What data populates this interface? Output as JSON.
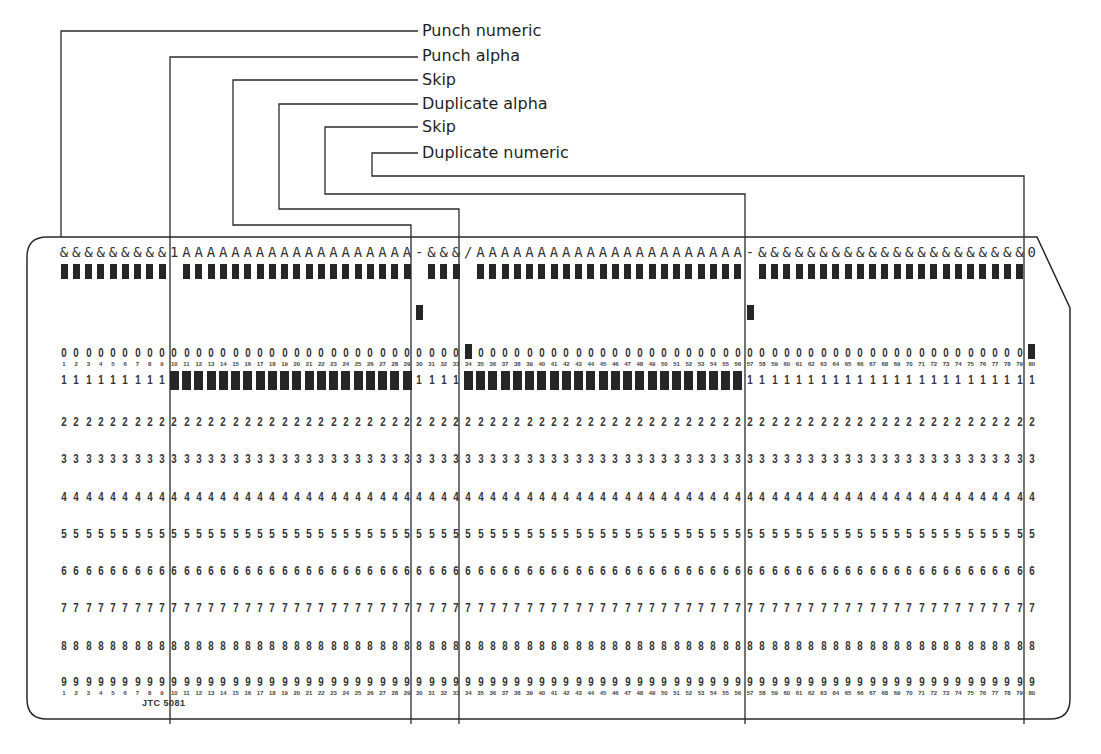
{
  "figure": {
    "labels": [
      {
        "id": "punch-numeric",
        "text": "Punch numeric",
        "columns": [
          1,
          9
        ]
      },
      {
        "id": "punch-alpha",
        "text": "Punch alpha",
        "columns": [
          10,
          29
        ]
      },
      {
        "id": "skip-1",
        "text": "Skip",
        "columns": [
          30,
          33
        ]
      },
      {
        "id": "duplicate-alpha",
        "text": "Duplicate alpha",
        "columns": [
          34,
          56
        ]
      },
      {
        "id": "skip-2",
        "text": "Skip",
        "columns": [
          57,
          79
        ]
      },
      {
        "id": "duplicate-numeric",
        "text": "Duplicate numeric",
        "columns": [
          80,
          80
        ]
      }
    ],
    "card": {
      "printed_header": "&&&&&&&&&1AAAAAAAAAAAAAAAAAAA-&&&/AAAAAAAAAAAAAAAAAAAAAA-&&&&&&&&&&&&&&&&&&&&&&0",
      "columns": 80,
      "row_digits": [
        "0",
        "1",
        "2",
        "3",
        "4",
        "5",
        "6",
        "7",
        "8",
        "9"
      ],
      "stamp": "JTC 5081",
      "field_dividers_after_column": [
        9,
        29,
        33,
        56,
        79
      ],
      "punches": {
        "row_12": [
          1,
          2,
          3,
          4,
          5,
          6,
          7,
          8,
          9,
          11,
          12,
          13,
          14,
          15,
          16,
          17,
          18,
          19,
          20,
          21,
          22,
          23,
          24,
          25,
          26,
          27,
          28,
          29,
          31,
          32,
          33,
          35,
          36,
          37,
          38,
          39,
          40,
          41,
          42,
          43,
          44,
          45,
          46,
          47,
          48,
          49,
          50,
          51,
          52,
          53,
          54,
          55,
          56,
          58,
          59,
          60,
          61,
          62,
          63,
          64,
          65,
          66,
          67,
          68,
          69,
          70,
          71,
          72,
          73,
          74,
          75,
          76,
          77,
          78,
          79
        ],
        "row_11": [
          30,
          57
        ],
        "row_0": [
          34,
          80
        ],
        "row_1": [
          10,
          11,
          12,
          13,
          14,
          15,
          16,
          17,
          18,
          19,
          20,
          21,
          22,
          23,
          24,
          25,
          26,
          27,
          28,
          29,
          34,
          35,
          36,
          37,
          38,
          39,
          40,
          41,
          42,
          43,
          44,
          45,
          46,
          47,
          48,
          49,
          50,
          51,
          52,
          53,
          54,
          55,
          56
        ]
      }
    }
  }
}
